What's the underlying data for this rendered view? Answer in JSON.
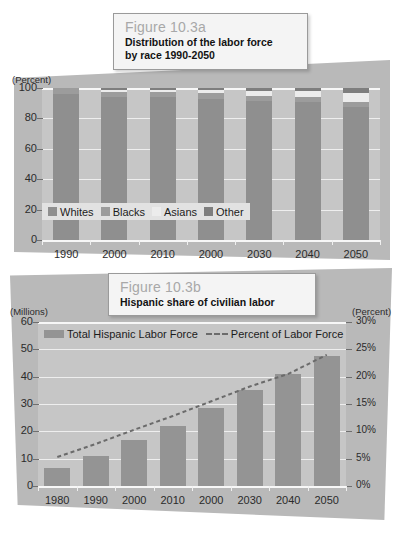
{
  "figure_a": {
    "card": {
      "number": "Figure 10.3a",
      "title_line1": "Distribution of the labor force",
      "title_line2": "by race 1990-2050"
    },
    "axis_note": "(Percent)",
    "legend": [
      {
        "label": "Whites",
        "color": "#8f8f8f"
      },
      {
        "label": "Blacks",
        "color": "#9c9c9c"
      },
      {
        "label": "Asians",
        "color": "#ececec"
      },
      {
        "label": "Other",
        "color": "#7e7e7e"
      }
    ],
    "chart_data": {
      "type": "bar",
      "stacked": true,
      "title": "Distribution of the labor force by race 1990-2050",
      "xlabel": "",
      "ylabel": "(Percent)",
      "ylim": [
        0,
        100
      ],
      "yticks": [
        "0",
        "20",
        "40",
        "60",
        "80",
        "100"
      ],
      "grid": true,
      "legend_position": "inside-bottom-left",
      "categories": [
        "1990",
        "2000",
        "2010",
        "2000",
        "2030",
        "2040",
        "2050"
      ],
      "series": [
        {
          "name": "Whites",
          "color": "#8f8f8f",
          "values": [
            96,
            94,
            94,
            93,
            91.5,
            90.5,
            87.5
          ]
        },
        {
          "name": "Blacks",
          "color": "#9c9c9c",
          "values": [
            4,
            3.5,
            3.5,
            3.5,
            3.5,
            3.5,
            3.5
          ]
        },
        {
          "name": "Asians",
          "color": "#ececec",
          "values": [
            0,
            1.5,
            1.5,
            2,
            3,
            4,
            6
          ]
        },
        {
          "name": "Other",
          "color": "#7e7e7e",
          "values": [
            0,
            1,
            1,
            1.5,
            2,
            2,
            3
          ]
        }
      ]
    }
  },
  "figure_b": {
    "card": {
      "number": "Figure 10.3b",
      "title": "Hispanic share of civilian labor"
    },
    "axis_note_left": "(Millions)",
    "axis_note_right": "(Percent)",
    "legend": [
      {
        "label": "Total Hispanic Labor Force",
        "marker": "bar-swatch",
        "color": "#949494"
      },
      {
        "label": "Percent of Labor Force",
        "marker": "dashed-line",
        "color": "#6b6b6b"
      }
    ],
    "chart_data": {
      "type": "bar",
      "combo": "bar+line",
      "title": "Hispanic share of civilian labor",
      "xlabel": "",
      "ylabel": "(Millions)",
      "y2label": "(Percent)",
      "ylim": [
        0,
        60
      ],
      "yticks": [
        "0",
        "10",
        "20",
        "30",
        "40",
        "50",
        "60"
      ],
      "y2lim": [
        0,
        30
      ],
      "y2ticks": [
        "0%",
        "5%",
        "10%",
        "15%",
        "20%",
        "25%",
        "30%"
      ],
      "grid": true,
      "legend_position": "top-inside",
      "categories": [
        "1980",
        "1990",
        "2000",
        "2010",
        "2000",
        "2030",
        "2040",
        "2050"
      ],
      "series": [
        {
          "name": "Total Hispanic Labor Force",
          "type": "bar",
          "axis": "left",
          "unit": "millions",
          "color": "#949494",
          "values": [
            6.5,
            10.8,
            17.0,
            22.0,
            28.5,
            35.0,
            41.0,
            47.5
          ]
        },
        {
          "name": "Percent of Labor Force",
          "type": "line",
          "style": "dashed",
          "axis": "right",
          "unit": "percent",
          "color": "#6b6b6b",
          "values": [
            5.3,
            7.7,
            10.3,
            12.8,
            15.5,
            18.2,
            20.5,
            24.0
          ]
        }
      ]
    }
  }
}
